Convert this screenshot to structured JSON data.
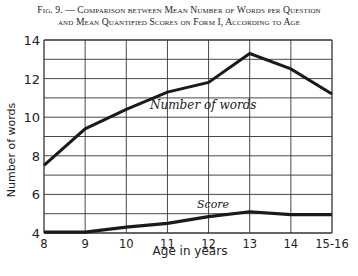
{
  "title": {
    "line1": "Fig. 9. — Comparison between Mean Number of Words per Question",
    "line2": "and Mean Quantified Scores on Form I, According to Age"
  },
  "axes": {
    "xlabel": "Age in years",
    "ylabel": "Number of words",
    "x_ticks": [
      "8",
      "9",
      "10",
      "11",
      "12",
      "13",
      "14",
      "15-16"
    ],
    "y_ticks": [
      "4",
      "6",
      "8",
      "10",
      "12",
      "14"
    ]
  },
  "annotations": {
    "words_label": "Number of words",
    "score_label": "Score"
  },
  "colors": {
    "line": "#1a1a1a",
    "grid": "#333333",
    "background": "#ffffff"
  },
  "chart_data": {
    "type": "line",
    "title": "Fig. 9. — Comparison between Mean Number of Words per Question and Mean Quantified Scores on Form I, According to Age",
    "xlabel": "Age in years",
    "ylabel": "Number of words",
    "categories": [
      "8",
      "9",
      "10",
      "11",
      "12",
      "13",
      "14",
      "15-16"
    ],
    "series": [
      {
        "name": "Number of words",
        "values": [
          7.5,
          9.4,
          10.4,
          11.3,
          11.8,
          13.3,
          12.5,
          11.2
        ]
      },
      {
        "name": "Score",
        "values": [
          4.05,
          4.05,
          4.3,
          4.5,
          4.85,
          5.1,
          4.95,
          4.95
        ]
      }
    ],
    "ylim": [
      4,
      14
    ],
    "y_ticks": [
      4,
      6,
      8,
      10,
      12,
      14
    ],
    "grid": true,
    "grid_y_step": 1,
    "legend": "inline labels on lines"
  }
}
